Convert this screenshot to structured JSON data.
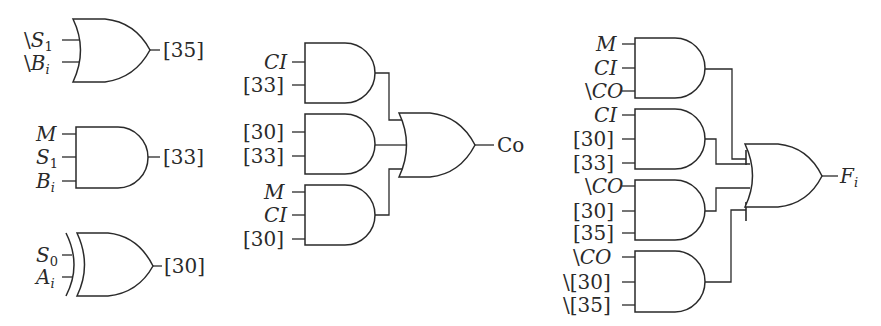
{
  "diagram": {
    "type": "logic-circuit",
    "left_column": {
      "or_gate_35": {
        "inputs": [
          "\\S1",
          "\\Bi"
        ],
        "output": "[35]"
      },
      "and_gate_33": {
        "inputs": [
          "M",
          "S1",
          "Bi"
        ],
        "output": "[33]"
      },
      "xor_gate_30": {
        "inputs": [
          "S0",
          "Ai"
        ],
        "output": "[30]"
      }
    },
    "carry_circuit": {
      "and_gates": [
        {
          "inputs": [
            "CI",
            "[33]"
          ]
        },
        {
          "inputs": [
            "[30]",
            "[33]"
          ]
        },
        {
          "inputs": [
            "M",
            "CI",
            "[30]"
          ]
        }
      ],
      "or_gate": {
        "output": "Co"
      }
    },
    "function_circuit": {
      "and_gates": [
        {
          "inputs": [
            "M",
            "CI",
            "\\CO"
          ]
        },
        {
          "inputs": [
            "CI",
            "[30]",
            "[33]"
          ]
        },
        {
          "inputs": [
            "\\CO",
            "[30]",
            "[35]"
          ]
        },
        {
          "inputs": [
            "\\CO",
            "\\[30]",
            "\\[35]"
          ]
        }
      ],
      "or_gate": {
        "output": "Fi"
      }
    }
  },
  "labels": {
    "bs": "\\",
    "S": "S",
    "B": "B",
    "M": "M",
    "A": "A",
    "sub1": "1",
    "sub0": "0",
    "subi": "i",
    "n35": "[35]",
    "n33": "[33]",
    "n30": "[30]",
    "CI": "CI",
    "CO": "CO",
    "Co": "Co",
    "F": "F",
    "bs30": "\\[30]",
    "bs35": "\\[35]"
  }
}
